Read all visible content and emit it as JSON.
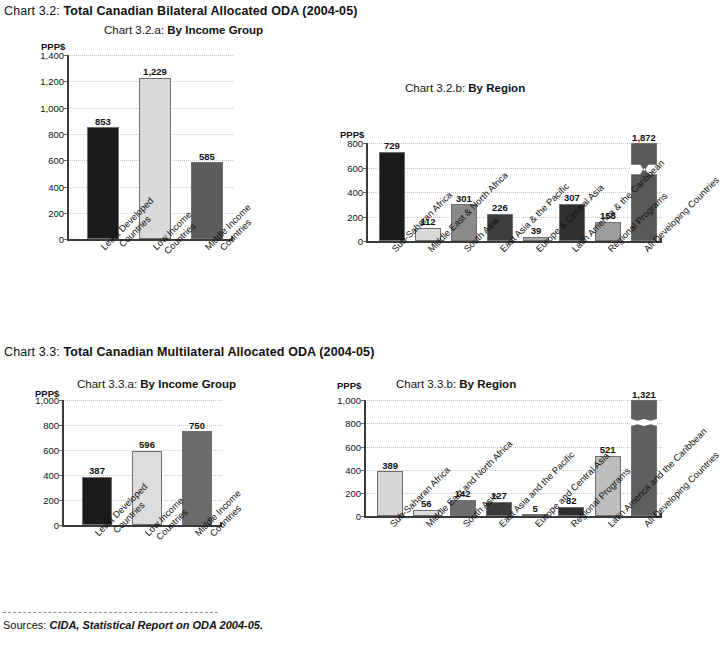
{
  "figure": {
    "chart32": {
      "number": "Chart 3.2:",
      "title": "Total Canadian Bilateral Allocated ODA (2004-05)"
    },
    "chart33": {
      "number": "Chart 3.3:",
      "title": "Total Canadian Multilateral Allocated ODA (2004-05)"
    },
    "source": {
      "label": "Sources:",
      "text": "CIDA, Statistical Report on ODA 2004-05."
    }
  },
  "chart_data": [
    {
      "id": "chart-3-2-a",
      "type": "bar",
      "number": "Chart 3.2.a:",
      "title": "By Income Group",
      "ylabel": "PPP$",
      "xlabel": "",
      "categories": [
        "Least Developed\nCountries",
        "Low Income\nCountries",
        "Middle Income\nCountries"
      ],
      "category_lines": [
        [
          "Least Developed",
          "Countries"
        ],
        [
          "Low Income",
          "Countries"
        ],
        [
          "Middle Income",
          "Countries"
        ]
      ],
      "values": [
        853,
        1229,
        585
      ],
      "value_labels": [
        "853",
        "1,229",
        "585"
      ],
      "colors": [
        "#1b1b1b",
        "#d9d9d9",
        "#5c5c5c"
      ],
      "ylim": [
        0,
        1400
      ],
      "yticks": [
        0,
        200,
        400,
        600,
        800,
        1000,
        1200,
        1400
      ],
      "ytick_labels": [
        "0",
        "200",
        "400",
        "600",
        "800",
        "1,000",
        "1,200",
        "1,400"
      ],
      "grid": true,
      "legend": "none"
    },
    {
      "id": "chart-3-2-b",
      "type": "bar",
      "number": "Chart 3.2.b:",
      "title": "By Region",
      "ylabel": "PPP$",
      "xlabel": "",
      "categories": [
        "Sub-Saharan Africa",
        "Middle East & North Africa",
        "South Asia",
        "East Asia & the Pacific",
        "Europe & Central Asia",
        "Latin America & the Caribbean",
        "Regional Programs",
        "All Developing Countries"
      ],
      "values": [
        729,
        112,
        301,
        226,
        39,
        307,
        158,
        1872
      ],
      "value_labels": [
        "729",
        "112",
        "301",
        "226",
        "39",
        "307",
        "158",
        "1,872"
      ],
      "colors": [
        "#1b1b1b",
        "#d9d9d9",
        "#8a8a8a",
        "#3d3d3d",
        "#a8a8a8",
        "#303030",
        "#9d9d9d",
        "#595959"
      ],
      "ylim": [
        0,
        800
      ],
      "yticks": [
        0,
        200,
        400,
        600,
        800
      ],
      "ytick_labels": [
        "0",
        "200",
        "400",
        "600",
        "800"
      ],
      "axis_break": {
        "series_index": 7,
        "note": "broken axis zigzag on All Developing Countries bar"
      },
      "grid": true,
      "legend": "none"
    },
    {
      "id": "chart-3-3-a",
      "type": "bar",
      "number": "Chart 3.3.a:",
      "title": "By Income Group",
      "ylabel": "PPP$",
      "xlabel": "",
      "categories": [
        "Least Developed\nCountries",
        "Low Income\nCountries",
        "Middle Income\nCountries"
      ],
      "category_lines": [
        [
          "Least Developed",
          "Countries"
        ],
        [
          "Low Income",
          "Countries"
        ],
        [
          "Middle Income",
          "Countries"
        ]
      ],
      "values": [
        387,
        596,
        750
      ],
      "value_labels": [
        "387",
        "596",
        "750"
      ],
      "colors": [
        "#1b1b1b",
        "#dcdcdc",
        "#6b6b6b"
      ],
      "ylim": [
        0,
        1000
      ],
      "yticks": [
        0,
        200,
        400,
        600,
        800,
        1000
      ],
      "ytick_labels": [
        "0",
        "200",
        "400",
        "600",
        "800",
        "1,000"
      ],
      "grid": true,
      "legend": "none"
    },
    {
      "id": "chart-3-3-b",
      "type": "bar",
      "number": "Chart 3.3.b:",
      "title": "By Region",
      "ylabel": "PPP$",
      "xlabel": "",
      "categories": [
        "Sub-Saharan Africa",
        "Middle East and North Africa",
        "South Asia",
        "East Asia and the Pacific",
        "Europe and Central Asia",
        "Regional Programs",
        "Latin America and the Caribbean",
        "All Developing Countries"
      ],
      "values": [
        389,
        56,
        142,
        127,
        5,
        82,
        521,
        1321
      ],
      "value_labels": [
        "389",
        "56",
        "142",
        "127",
        "5",
        "82",
        "521",
        "1,321"
      ],
      "colors": [
        "#d5d5d5",
        "#dcdcdc",
        "#6e6e6e",
        "#3a3a3a",
        "#c0c0c0",
        "#2e2e2e",
        "#bdbdbd",
        "#5f5f5f"
      ],
      "ylim": [
        0,
        1000
      ],
      "yticks": [
        0,
        200,
        400,
        600,
        800,
        1000
      ],
      "ytick_labels": [
        "0",
        "200",
        "400",
        "600",
        "800",
        "1,000"
      ],
      "axis_break": {
        "series_index": 7,
        "note": "broken axis wave on All Developing Countries bar"
      },
      "grid": true,
      "legend": "none"
    }
  ]
}
